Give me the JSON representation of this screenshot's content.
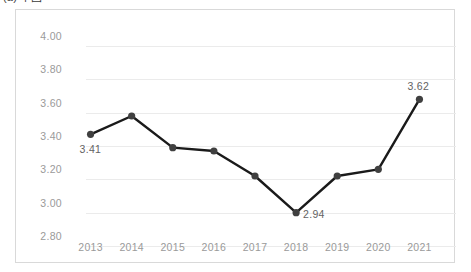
{
  "figure": {
    "caption": "(a) 中国"
  },
  "chart_data": {
    "type": "line",
    "title": "",
    "subtitle": "",
    "xlabel": "",
    "ylabel": "",
    "categories": [
      "2013",
      "2014",
      "2015",
      "2016",
      "2017",
      "2018",
      "2019",
      "2020",
      "2021"
    ],
    "values": [
      3.41,
      3.52,
      3.33,
      3.31,
      3.16,
      2.94,
      3.16,
      3.2,
      3.62
    ],
    "series": [
      {
        "name": "",
        "values": [
          3.41,
          3.52,
          3.33,
          3.31,
          3.16,
          2.94,
          3.16,
          3.2,
          3.62
        ]
      }
    ],
    "ylim": [
      2.8,
      4.0
    ],
    "ytick_step": 0.2,
    "ytick_labels": [
      "4.00",
      "3.80",
      "3.60",
      "3.40",
      "3.20",
      "3.00",
      "2.80"
    ],
    "ytick_values": [
      4.0,
      3.8,
      3.6,
      3.4,
      3.2,
      3.0,
      2.8
    ],
    "grid": true,
    "grid_axis": "y",
    "legend": false,
    "legend_position": "none",
    "line_color": "#1a1a1a",
    "marker_color": "#404040",
    "grid_color": "#ebebeb",
    "tick_label_color": "#9a9a9a",
    "data_label_color": "#636363",
    "data_labels": [
      {
        "category": "2013",
        "value": 3.41,
        "text": "3.41",
        "position": "below-left"
      },
      {
        "category": "2018",
        "value": 2.94,
        "text": "2.94",
        "position": "right"
      },
      {
        "category": "2021",
        "value": 3.62,
        "text": "3.62",
        "position": "above"
      }
    ]
  }
}
